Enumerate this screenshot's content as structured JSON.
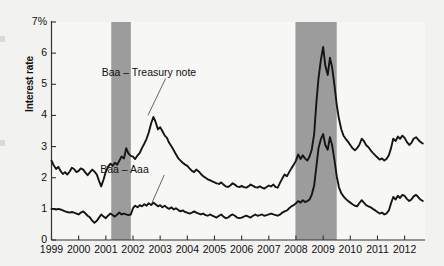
{
  "chart_data": {
    "type": "line",
    "title": "",
    "subtitle": "",
    "xlabel": "",
    "ylabel": "Interest rate",
    "ylim": [
      0,
      7
    ],
    "xlim": [
      1999,
      2012.75
    ],
    "grid": false,
    "legend_position": "inline-annotations",
    "y_ticks": [
      "0",
      "1",
      "2",
      "3",
      "4",
      "5",
      "6",
      "7%"
    ],
    "y_tick_values": [
      0,
      1,
      2,
      3,
      4,
      5,
      6,
      7
    ],
    "x_ticks": [
      "1999",
      "2000",
      "2001",
      "2002",
      "2003",
      "2004",
      "2005",
      "2006",
      "2007",
      "2008",
      "2009",
      "2010",
      "2011",
      "2012"
    ],
    "x_tick_values": [
      1999,
      2000,
      2001,
      2002,
      2003,
      2004,
      2005,
      2006,
      2007,
      2008,
      2009,
      2010,
      2011,
      2012
    ],
    "annotations": [
      {
        "text": "Baa – Treasury note",
        "x": 2001.95,
        "y": 5.35,
        "points_to_x": 2002.55,
        "points_to_y": 4.0
      },
      {
        "text": "Baa – Aaa",
        "x": 2001.9,
        "y": 2.25,
        "points_to_x": 2002.7,
        "points_to_y": 1.2
      }
    ],
    "shaded_regions": [
      {
        "name": "recession-2001",
        "x_start": 2001.2,
        "x_end": 2001.92,
        "color": "#9c9c9c"
      },
      {
        "name": "recession-2008",
        "x_start": 2007.98,
        "x_end": 2009.5,
        "color": "#9c9c9c"
      }
    ],
    "series": [
      {
        "name": "Baa – Treasury note",
        "color": "#151515",
        "x": [
          1999.0,
          1999.08,
          1999.17,
          1999.25,
          1999.33,
          1999.42,
          1999.5,
          1999.58,
          1999.67,
          1999.75,
          1999.83,
          1999.92,
          2000.0,
          2000.08,
          2000.17,
          2000.25,
          2000.33,
          2000.42,
          2000.5,
          2000.58,
          2000.67,
          2000.75,
          2000.83,
          2000.92,
          2001.0,
          2001.08,
          2001.17,
          2001.25,
          2001.33,
          2001.42,
          2001.5,
          2001.58,
          2001.67,
          2001.75,
          2001.83,
          2001.92,
          2002.0,
          2002.08,
          2002.17,
          2002.25,
          2002.33,
          2002.42,
          2002.5,
          2002.58,
          2002.67,
          2002.75,
          2002.83,
          2002.92,
          2003.0,
          2003.08,
          2003.17,
          2003.25,
          2003.33,
          2003.42,
          2003.5,
          2003.58,
          2003.67,
          2003.75,
          2003.83,
          2003.92,
          2004.0,
          2004.08,
          2004.17,
          2004.25,
          2004.33,
          2004.42,
          2004.5,
          2004.58,
          2004.67,
          2004.75,
          2004.83,
          2004.92,
          2005.0,
          2005.08,
          2005.17,
          2005.25,
          2005.33,
          2005.42,
          2005.5,
          2005.58,
          2005.67,
          2005.75,
          2005.83,
          2005.92,
          2006.0,
          2006.08,
          2006.17,
          2006.25,
          2006.33,
          2006.42,
          2006.5,
          2006.58,
          2006.67,
          2006.75,
          2006.83,
          2006.92,
          2007.0,
          2007.08,
          2007.17,
          2007.25,
          2007.33,
          2007.42,
          2007.5,
          2007.58,
          2007.67,
          2007.75,
          2007.83,
          2007.92,
          2008.0,
          2008.08,
          2008.17,
          2008.25,
          2008.33,
          2008.42,
          2008.5,
          2008.58,
          2008.67,
          2008.75,
          2008.83,
          2008.92,
          2009.0,
          2009.08,
          2009.17,
          2009.25,
          2009.33,
          2009.42,
          2009.5,
          2009.58,
          2009.67,
          2009.75,
          2009.83,
          2009.92,
          2010.0,
          2010.08,
          2010.17,
          2010.25,
          2010.33,
          2010.42,
          2010.5,
          2010.58,
          2010.67,
          2010.75,
          2010.83,
          2010.92,
          2011.0,
          2011.08,
          2011.17,
          2011.25,
          2011.33,
          2011.42,
          2011.5,
          2011.58,
          2011.67,
          2011.75,
          2011.83,
          2011.92,
          2012.0,
          2012.08,
          2012.17,
          2012.25,
          2012.33,
          2012.42,
          2012.5,
          2012.58,
          2012.67
        ],
        "y": [
          2.55,
          2.4,
          2.28,
          2.35,
          2.22,
          2.12,
          2.18,
          2.1,
          2.2,
          2.32,
          2.28,
          2.18,
          2.22,
          2.3,
          2.26,
          2.16,
          2.08,
          2.18,
          2.26,
          2.2,
          2.1,
          1.9,
          1.72,
          1.95,
          2.2,
          2.35,
          2.45,
          2.38,
          2.48,
          2.42,
          2.55,
          2.68,
          2.62,
          2.95,
          2.78,
          2.7,
          2.68,
          2.6,
          2.72,
          2.8,
          2.95,
          3.1,
          3.25,
          3.45,
          3.75,
          3.95,
          3.8,
          3.55,
          3.62,
          3.5,
          3.35,
          3.28,
          3.12,
          3.0,
          2.88,
          2.75,
          2.62,
          2.55,
          2.48,
          2.42,
          2.38,
          2.3,
          2.22,
          2.18,
          2.26,
          2.2,
          2.12,
          2.05,
          2.0,
          1.95,
          1.92,
          1.88,
          1.85,
          1.82,
          1.8,
          1.85,
          1.78,
          1.72,
          1.7,
          1.75,
          1.82,
          1.78,
          1.72,
          1.7,
          1.74,
          1.7,
          1.68,
          1.72,
          1.78,
          1.74,
          1.7,
          1.68,
          1.72,
          1.68,
          1.65,
          1.7,
          1.75,
          1.72,
          1.78,
          1.7,
          1.68,
          1.85,
          1.98,
          2.1,
          2.05,
          2.18,
          2.3,
          2.42,
          2.55,
          2.75,
          2.6,
          2.72,
          2.62,
          2.55,
          2.68,
          2.9,
          3.4,
          4.4,
          5.2,
          5.8,
          6.2,
          5.6,
          5.3,
          5.85,
          5.55,
          4.95,
          4.35,
          3.9,
          3.55,
          3.35,
          3.25,
          3.15,
          3.05,
          2.95,
          2.88,
          2.95,
          3.05,
          3.25,
          3.18,
          3.05,
          2.98,
          2.88,
          2.8,
          2.72,
          2.65,
          2.58,
          2.62,
          2.55,
          2.6,
          2.72,
          2.95,
          3.25,
          3.18,
          3.32,
          3.25,
          3.35,
          3.28,
          3.15,
          3.05,
          3.12,
          3.25,
          3.3,
          3.22,
          3.15,
          3.1
        ]
      },
      {
        "name": "Baa – Aaa",
        "color": "#151515",
        "x": [
          1999.0,
          1999.08,
          1999.17,
          1999.25,
          1999.33,
          1999.42,
          1999.5,
          1999.58,
          1999.67,
          1999.75,
          1999.83,
          1999.92,
          2000.0,
          2000.08,
          2000.17,
          2000.25,
          2000.33,
          2000.42,
          2000.5,
          2000.58,
          2000.67,
          2000.75,
          2000.83,
          2000.92,
          2001.0,
          2001.08,
          2001.17,
          2001.25,
          2001.33,
          2001.42,
          2001.5,
          2001.58,
          2001.67,
          2001.75,
          2001.83,
          2001.92,
          2002.0,
          2002.08,
          2002.17,
          2002.25,
          2002.33,
          2002.42,
          2002.5,
          2002.58,
          2002.67,
          2002.75,
          2002.83,
          2002.92,
          2003.0,
          2003.08,
          2003.17,
          2003.25,
          2003.33,
          2003.42,
          2003.5,
          2003.58,
          2003.67,
          2003.75,
          2003.83,
          2003.92,
          2004.0,
          2004.08,
          2004.17,
          2004.25,
          2004.33,
          2004.42,
          2004.5,
          2004.58,
          2004.67,
          2004.75,
          2004.83,
          2004.92,
          2005.0,
          2005.08,
          2005.17,
          2005.25,
          2005.33,
          2005.42,
          2005.5,
          2005.58,
          2005.67,
          2005.75,
          2005.83,
          2005.92,
          2006.0,
          2006.08,
          2006.17,
          2006.25,
          2006.33,
          2006.42,
          2006.5,
          2006.58,
          2006.67,
          2006.75,
          2006.83,
          2006.92,
          2007.0,
          2007.08,
          2007.17,
          2007.25,
          2007.33,
          2007.42,
          2007.5,
          2007.58,
          2007.67,
          2007.75,
          2007.83,
          2007.92,
          2008.0,
          2008.08,
          2008.17,
          2008.25,
          2008.33,
          2008.42,
          2008.5,
          2008.58,
          2008.67,
          2008.75,
          2008.83,
          2008.92,
          2009.0,
          2009.08,
          2009.17,
          2009.25,
          2009.33,
          2009.42,
          2009.5,
          2009.58,
          2009.67,
          2009.75,
          2009.83,
          2009.92,
          2010.0,
          2010.08,
          2010.17,
          2010.25,
          2010.33,
          2010.42,
          2010.5,
          2010.58,
          2010.67,
          2010.75,
          2010.83,
          2010.92,
          2011.0,
          2011.08,
          2011.17,
          2011.25,
          2011.33,
          2011.42,
          2011.5,
          2011.58,
          2011.67,
          2011.75,
          2011.83,
          2011.92,
          2012.0,
          2012.08,
          2012.17,
          2012.25,
          2012.33,
          2012.42,
          2012.5,
          2012.58,
          2012.67
        ],
        "y": [
          1.0,
          1.0,
          0.98,
          1.0,
          0.98,
          0.95,
          0.92,
          0.9,
          0.88,
          0.9,
          0.88,
          0.85,
          0.82,
          0.88,
          0.92,
          0.85,
          0.78,
          0.72,
          0.62,
          0.55,
          0.62,
          0.72,
          0.82,
          0.75,
          0.7,
          0.78,
          0.85,
          0.8,
          0.75,
          0.82,
          0.88,
          0.82,
          0.85,
          0.82,
          0.8,
          0.82,
          1.02,
          1.1,
          1.05,
          1.12,
          1.08,
          1.15,
          1.1,
          1.18,
          1.12,
          1.2,
          1.15,
          1.08,
          1.12,
          1.05,
          1.1,
          1.04,
          1.0,
          1.05,
          0.98,
          1.02,
          0.96,
          0.92,
          0.95,
          0.9,
          0.88,
          0.85,
          0.88,
          0.92,
          0.88,
          0.85,
          0.82,
          0.85,
          0.8,
          0.78,
          0.82,
          0.78,
          0.75,
          0.72,
          0.78,
          0.82,
          0.75,
          0.7,
          0.72,
          0.78,
          0.82,
          0.78,
          0.72,
          0.7,
          0.72,
          0.75,
          0.78,
          0.75,
          0.72,
          0.78,
          0.82,
          0.78,
          0.8,
          0.82,
          0.78,
          0.8,
          0.82,
          0.85,
          0.82,
          0.8,
          0.78,
          0.82,
          0.88,
          0.92,
          0.95,
          1.02,
          1.08,
          1.12,
          1.18,
          1.25,
          1.2,
          1.28,
          1.22,
          1.25,
          1.3,
          1.45,
          1.75,
          2.35,
          2.95,
          3.25,
          3.4,
          3.05,
          2.9,
          3.3,
          3.05,
          2.55,
          2.05,
          1.7,
          1.5,
          1.4,
          1.32,
          1.25,
          1.2,
          1.15,
          1.1,
          1.08,
          1.18,
          1.28,
          1.2,
          1.12,
          1.08,
          1.05,
          1.0,
          0.95,
          0.9,
          0.85,
          0.88,
          0.82,
          0.85,
          0.95,
          1.18,
          1.38,
          1.3,
          1.42,
          1.35,
          1.45,
          1.42,
          1.32,
          1.25,
          1.3,
          1.4,
          1.45,
          1.38,
          1.3,
          1.25
        ]
      }
    ]
  }
}
